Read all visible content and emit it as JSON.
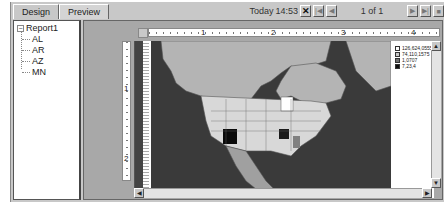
{
  "tabs": [
    {
      "label": "Design",
      "active": false
    },
    {
      "label": "Preview",
      "active": true
    }
  ],
  "toolbar": {
    "date_label": "Today",
    "time": "14:53",
    "close_glyph": "✕",
    "first_glyph": "|◀",
    "prev_glyph": "◀",
    "page_label": "1 of 1",
    "next_glyph": "▶",
    "last_glyph": "▶|",
    "stop_glyph": "■"
  },
  "tree": {
    "root": {
      "label": "Report1",
      "expander": "−"
    },
    "items": [
      {
        "label": "AL"
      },
      {
        "label": "AR"
      },
      {
        "label": "AZ"
      },
      {
        "label": "MN"
      }
    ]
  },
  "ruler": {
    "horizontal_numbers": [
      "1",
      "2",
      "3",
      "4"
    ],
    "vertical_numbers": [
      "1",
      "2"
    ]
  },
  "legend": {
    "items": [
      {
        "label": "126,624,0555",
        "color": "#ffffff"
      },
      {
        "label": "74,110,1575",
        "color": "#c8c8c8"
      },
      {
        "label": "1,0707",
        "color": "#707070"
      },
      {
        "label": "7,23,4",
        "color": "#101010"
      }
    ]
  },
  "map": {
    "colors": {
      "ocean": "#3a3a3a",
      "land": "#b4b4b4",
      "us_states": "#d8d8d8",
      "mexico": "#a0a0a0",
      "az": "#0a0a0a",
      "ar": "#1a1a1a",
      "al": "#808080",
      "mn": "#ffffff"
    }
  },
  "scrollbars": {
    "up": "▲",
    "down": "▼",
    "left": "◀",
    "right": "▶"
  }
}
